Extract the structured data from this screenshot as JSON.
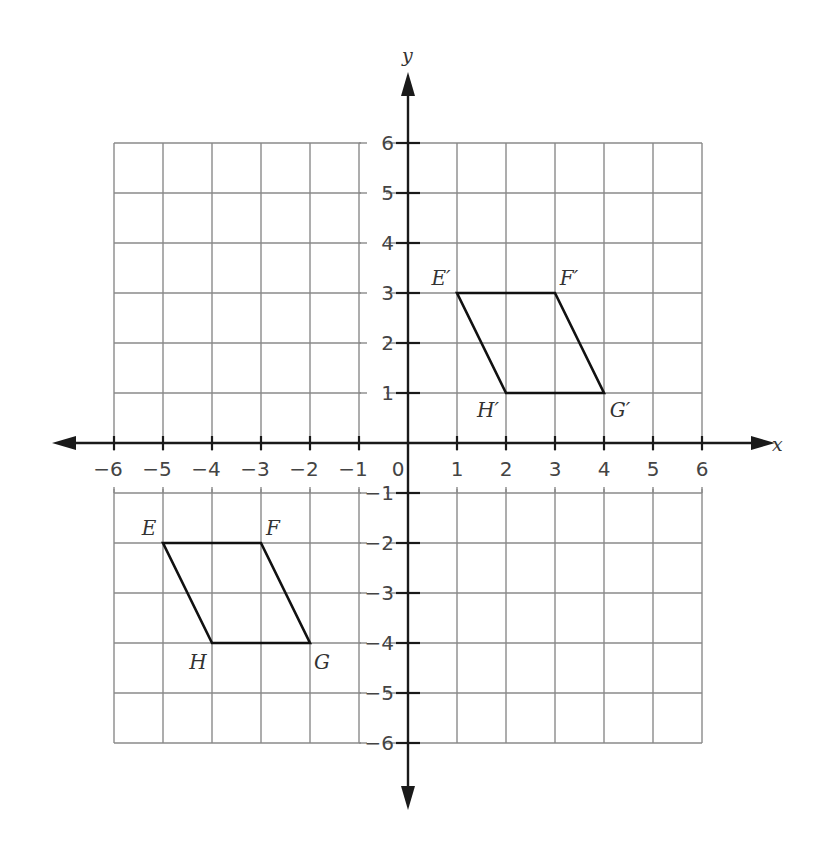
{
  "graph": {
    "x_axis_label": "x",
    "y_axis_label": "y",
    "x_ticks": [
      "−6",
      "−5",
      "−4",
      "−3",
      "−2",
      "−1",
      "0",
      "1",
      "2",
      "3",
      "4",
      "5",
      "6"
    ],
    "y_ticks_positive": [
      "1",
      "2",
      "3",
      "4",
      "5",
      "6"
    ],
    "y_ticks_negative": [
      "−1",
      "−2",
      "−3",
      "−4",
      "−5",
      "−6"
    ],
    "x_range": [
      -6,
      6
    ],
    "y_range": [
      -6,
      6
    ],
    "grid_color": "#8a8a8a",
    "axis_color": "#1a1a1a",
    "shape_color": "#111111"
  },
  "shapes": {
    "original": {
      "name": "EFGH",
      "vertices": [
        {
          "label": "E",
          "x": -5,
          "y": -2
        },
        {
          "label": "F",
          "x": -3,
          "y": -2
        },
        {
          "label": "G",
          "x": -2,
          "y": -4
        },
        {
          "label": "H",
          "x": -4,
          "y": -4
        }
      ]
    },
    "image": {
      "name": "E'F'G'H'",
      "vertices": [
        {
          "label": "E′",
          "x": 1,
          "y": 3
        },
        {
          "label": "F′",
          "x": 3,
          "y": 3
        },
        {
          "label": "G′",
          "x": 4,
          "y": 1
        },
        {
          "label": "H′",
          "x": 2,
          "y": 1
        }
      ]
    }
  },
  "chart_data": {
    "type": "scatter",
    "title": "",
    "xlabel": "x",
    "ylabel": "y",
    "xlim": [
      -6,
      6
    ],
    "ylim": [
      -6,
      6
    ],
    "grid": true,
    "series": [
      {
        "name": "EFGH",
        "points": [
          [
            -5,
            -2
          ],
          [
            -3,
            -2
          ],
          [
            -2,
            -4
          ],
          [
            -4,
            -4
          ]
        ],
        "labels": [
          "E",
          "F",
          "G",
          "H"
        ],
        "closed": true
      },
      {
        "name": "E'F'G'H'",
        "points": [
          [
            1,
            3
          ],
          [
            3,
            3
          ],
          [
            4,
            1
          ],
          [
            2,
            1
          ]
        ],
        "labels": [
          "E′",
          "F′",
          "G′",
          "H′"
        ],
        "closed": true
      }
    ]
  }
}
